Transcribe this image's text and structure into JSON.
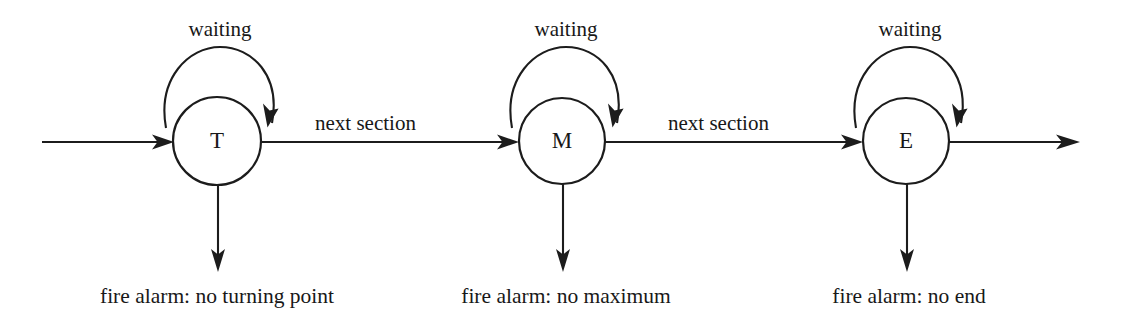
{
  "diagram": {
    "type": "finite-state-machine",
    "title": "",
    "background_color": "#ffffff",
    "stroke_color": "#1c1c1c",
    "states": [
      {
        "id": "T",
        "label": "T",
        "cx": 217,
        "cy": 141,
        "r": 44,
        "self_loop_label": "waiting",
        "alarm_label": "fire alarm: no turning point",
        "outgoing_label": "next section"
      },
      {
        "id": "M",
        "label": "M",
        "cx": 562,
        "cy": 141,
        "r": 43,
        "self_loop_label": "waiting",
        "alarm_label": "fire alarm: no maximum",
        "outgoing_label": "next section"
      },
      {
        "id": "E",
        "label": "E",
        "cx": 906,
        "cy": 141,
        "r": 43,
        "self_loop_label": "waiting",
        "alarm_label": "fire alarm: no end",
        "outgoing_label": ""
      }
    ],
    "transitions": [
      {
        "from": "start",
        "to": "T",
        "label": ""
      },
      {
        "from": "T",
        "to": "T",
        "label": "waiting"
      },
      {
        "from": "T",
        "to": "M",
        "label": "next section"
      },
      {
        "from": "M",
        "to": "M",
        "label": "waiting"
      },
      {
        "from": "M",
        "to": "E",
        "label": "next section"
      },
      {
        "from": "E",
        "to": "E",
        "label": "waiting"
      },
      {
        "from": "E",
        "to": "exit",
        "label": ""
      },
      {
        "from": "T",
        "to": "alarm",
        "label": "fire alarm: no turning point"
      },
      {
        "from": "M",
        "to": "alarm",
        "label": "fire alarm: no maximum"
      },
      {
        "from": "E",
        "to": "alarm",
        "label": "fire alarm: no end"
      }
    ],
    "labels": {
      "waiting_1": "waiting",
      "waiting_2": "waiting",
      "waiting_3": "waiting",
      "next_section_1": "next section",
      "next_section_2": "next section",
      "alarm_1": "fire alarm: no turning point",
      "alarm_2": "fire alarm: no maximum",
      "alarm_3": "fire alarm: no end",
      "state_t": "T",
      "state_m": "M",
      "state_e": "E"
    }
  }
}
